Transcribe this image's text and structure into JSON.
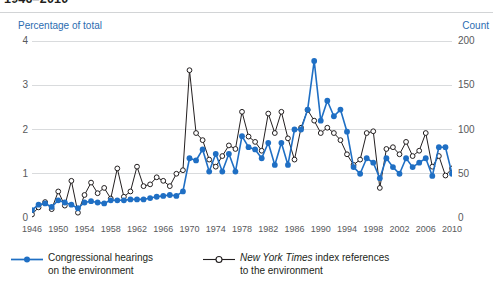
{
  "title": "1946–2010",
  "axes": {
    "left_caption": "Percentage of total",
    "right_caption": "Count",
    "left_ticks": [
      "4",
      "3",
      "2",
      "1",
      "0"
    ],
    "right_ticks": [
      "200",
      "150",
      "100",
      "50",
      "0"
    ],
    "x_ticks": [
      "1946",
      "1950",
      "1954",
      "1958",
      "1962",
      "1966",
      "1970",
      "1974",
      "1978",
      "1982",
      "1986",
      "1990",
      "1994",
      "1998",
      "2002",
      "2006",
      "2010"
    ]
  },
  "legend": {
    "series_a_line1": "Congressional hearings",
    "series_a_line2": "on the environment",
    "series_b_italic": "New York Times",
    "series_b_rest": " index references",
    "series_b_line2": "to the environment"
  },
  "colors": {
    "accent_blue": "#1f6fc4",
    "marker_blue": "#1f6fc4",
    "nyt_line": "#231f20",
    "grid": "#d9dbdd",
    "caption_blue": "#2b6cb0",
    "tick_text": "#58595b"
  },
  "chart_data": {
    "type": "line",
    "title": "1946–2010",
    "xlabel": "",
    "ylabel": "Percentage of total",
    "y2label": "Count",
    "ylim": [
      0,
      4
    ],
    "y2lim": [
      0,
      200
    ],
    "xlim": [
      1946,
      2010
    ],
    "grid": true,
    "legend_position": "bottom",
    "x": [
      1946,
      1947,
      1948,
      1949,
      1950,
      1951,
      1952,
      1953,
      1954,
      1955,
      1956,
      1957,
      1958,
      1959,
      1960,
      1961,
      1962,
      1963,
      1964,
      1965,
      1966,
      1967,
      1968,
      1969,
      1970,
      1971,
      1972,
      1973,
      1974,
      1975,
      1976,
      1977,
      1978,
      1979,
      1980,
      1981,
      1982,
      1983,
      1984,
      1985,
      1986,
      1987,
      1988,
      1989,
      1990,
      1991,
      1992,
      1993,
      1994,
      1995,
      1996,
      1997,
      1998,
      1999,
      2000,
      2001,
      2002,
      2003,
      2004,
      2005,
      2006,
      2007,
      2008,
      2009,
      2010
    ],
    "series": [
      {
        "name": "Congressional hearings on the environment",
        "axis": "left",
        "unit": "percentage of total",
        "color": "#1f6fc4",
        "marker": "filled-circle",
        "values": [
          0.18,
          0.3,
          0.33,
          0.25,
          0.4,
          0.35,
          0.3,
          0.22,
          0.35,
          0.38,
          0.35,
          0.33,
          0.4,
          0.4,
          0.4,
          0.42,
          0.42,
          0.42,
          0.45,
          0.48,
          0.5,
          0.52,
          0.5,
          0.6,
          1.35,
          1.3,
          1.55,
          1.05,
          1.45,
          1.05,
          1.45,
          1.05,
          1.85,
          1.6,
          1.55,
          1.35,
          1.7,
          1.2,
          1.7,
          1.2,
          2.0,
          2.0,
          2.45,
          3.55,
          2.2,
          2.65,
          2.3,
          2.45,
          1.95,
          1.15,
          1.0,
          1.35,
          1.25,
          0.9,
          1.35,
          1.15,
          1.0,
          1.35,
          1.15,
          1.25,
          1.35,
          0.95,
          1.6,
          1.6,
          1.0
        ]
      },
      {
        "name": "New York Times index references to the environment",
        "axis": "right",
        "unit": "count",
        "color": "#231f20",
        "marker": "open-circle",
        "values": [
          4,
          12,
          18,
          10,
          30,
          14,
          42,
          6,
          26,
          40,
          28,
          34,
          22,
          56,
          24,
          30,
          58,
          36,
          38,
          46,
          42,
          36,
          50,
          54,
          167,
          96,
          88,
          66,
          58,
          70,
          82,
          78,
          120,
          92,
          86,
          76,
          118,
          96,
          120,
          90,
          66,
          102,
          122,
          110,
          96,
          102,
          96,
          88,
          72,
          60,
          66,
          96,
          98,
          34,
          78,
          80,
          72,
          86,
          70,
          76,
          96,
          58,
          70,
          48,
          56
        ]
      }
    ]
  }
}
